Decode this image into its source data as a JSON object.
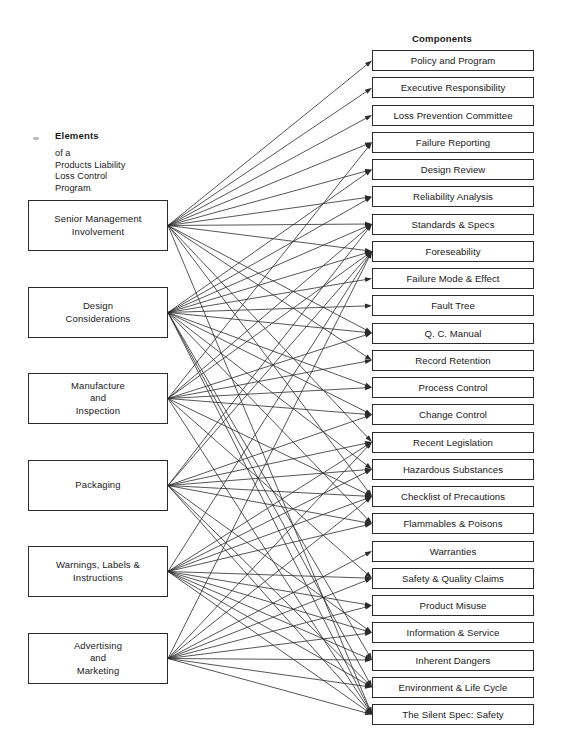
{
  "diagram": {
    "title_left": "Elements",
    "subtitle_left": "of a\nProducts Liability\nLoss Control\nProgram",
    "title_right": "Components",
    "stroke_color": "#2b2b2b",
    "background": "#ffffff"
  },
  "elements": [
    {
      "id": "e0",
      "label": "Senior Management\nInvolvement",
      "x": 28,
      "y": 200,
      "w": 140,
      "h": 51
    },
    {
      "id": "e1",
      "label": "Design\nConsiderations",
      "x": 28,
      "y": 287,
      "w": 140,
      "h": 51
    },
    {
      "id": "e2",
      "label": "Manufacture\nand\nInspection",
      "x": 28,
      "y": 373,
      "w": 140,
      "h": 51
    },
    {
      "id": "e3",
      "label": "Packaging",
      "x": 28,
      "y": 460,
      "w": 140,
      "h": 51
    },
    {
      "id": "e4",
      "label": "Warnings, Labels &\nInstructions",
      "x": 28,
      "y": 546,
      "w": 140,
      "h": 51
    },
    {
      "id": "e5",
      "label": "Advertising\nand\nMarketing",
      "x": 28,
      "y": 633,
      "w": 140,
      "h": 51
    }
  ],
  "components": [
    {
      "id": "c0",
      "label": "Policy and Program"
    },
    {
      "id": "c1",
      "label": "Executive Responsibility"
    },
    {
      "id": "c2",
      "label": "Loss Prevention Committee"
    },
    {
      "id": "c3",
      "label": "Failure Reporting"
    },
    {
      "id": "c4",
      "label": "Design Review"
    },
    {
      "id": "c5",
      "label": "Reliability Analysis"
    },
    {
      "id": "c6",
      "label": "Standards & Specs"
    },
    {
      "id": "c7",
      "label": "Foreseability"
    },
    {
      "id": "c8",
      "label": "Failure Mode & Effect"
    },
    {
      "id": "c9",
      "label": "Fault Tree"
    },
    {
      "id": "c10",
      "label": "Q. C. Manual"
    },
    {
      "id": "c11",
      "label": "Record Retention"
    },
    {
      "id": "c12",
      "label": "Process Control"
    },
    {
      "id": "c13",
      "label": "Change Control"
    },
    {
      "id": "c14",
      "label": "Recent Legislation"
    },
    {
      "id": "c15",
      "label": "Hazardous Substances"
    },
    {
      "id": "c16",
      "label": "Checklist of Precautions"
    },
    {
      "id": "c17",
      "label": "Flammables & Poisons"
    },
    {
      "id": "c18",
      "label": "Warranties"
    },
    {
      "id": "c19",
      "label": "Safety & Quality Claims"
    },
    {
      "id": "c20",
      "label": "Product Misuse"
    },
    {
      "id": "c21",
      "label": "Information & Service"
    },
    {
      "id": "c22",
      "label": "Inherent Dangers"
    },
    {
      "id": "c23",
      "label": "Environment & Life Cycle"
    },
    {
      "id": "c24",
      "label": "The Silent Spec: Safety"
    }
  ],
  "component_layout": {
    "x": 372,
    "w": 162,
    "h": 21,
    "first_top": 50,
    "pitch": 27.25
  },
  "links": [
    {
      "from": "e0",
      "to": [
        "c0",
        "c1",
        "c2",
        "c3",
        "c4",
        "c5",
        "c6",
        "c7",
        "c10",
        "c11",
        "c14",
        "c16",
        "c24"
      ]
    },
    {
      "from": "e1",
      "to": [
        "c4",
        "c5",
        "c6",
        "c7",
        "c8",
        "c9",
        "c10",
        "c12",
        "c13",
        "c15",
        "c17",
        "c22",
        "c23",
        "c24"
      ]
    },
    {
      "from": "e2",
      "to": [
        "c3",
        "c6",
        "c7",
        "c10",
        "c11",
        "c12",
        "c13",
        "c16",
        "c19",
        "c24"
      ]
    },
    {
      "from": "e3",
      "to": [
        "c6",
        "c7",
        "c13",
        "c14",
        "c15",
        "c16",
        "c17",
        "c21",
        "c23",
        "c24"
      ]
    },
    {
      "from": "e4",
      "to": [
        "c7",
        "c14",
        "c15",
        "c16",
        "c17",
        "c19",
        "c20",
        "c21",
        "c22",
        "c23",
        "c24"
      ]
    },
    {
      "from": "e5",
      "to": [
        "c7",
        "c14",
        "c16",
        "c18",
        "c19",
        "c20",
        "c21",
        "c22",
        "c23",
        "c24"
      ]
    }
  ]
}
